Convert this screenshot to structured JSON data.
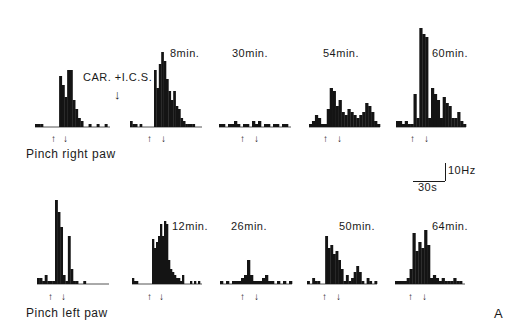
{
  "figure": {
    "panel_letter": "A",
    "treatment_label": "CAR. +I.C.S.",
    "row_labels": [
      "Pinch right paw",
      "Pinch left paw"
    ],
    "scale_bar": {
      "vertical": "10Hz",
      "horizontal": "30s"
    }
  },
  "chart_data": {
    "type": "bar",
    "title": "",
    "xlabel": "Time (bins)",
    "ylabel": "Firing rate (Hz)",
    "scale": {
      "y_bar": "10Hz",
      "x_bar": "30s"
    },
    "annotations": [
      "CAR. +I.C.S.",
      "A",
      "Pinch right paw",
      "Pinch left paw",
      "↑ pinch start",
      "↓ pinch end"
    ],
    "rows": [
      {
        "label": "Pinch right paw",
        "panels": [
          {
            "time": "control",
            "values": [
              1,
              1,
              1,
              0,
              0,
              0,
              0,
              0,
              0,
              17,
              14,
              10,
              19,
              19,
              9,
              6,
              3,
              2,
              0,
              0,
              1,
              0,
              0,
              1,
              0,
              0,
              1,
              0
            ]
          },
          {
            "time": "8min.",
            "values": [
              2,
              1,
              1,
              0,
              1,
              0,
              0,
              0,
              0,
              0,
              19,
              13,
              21,
              25,
              22,
              16,
              12,
              9,
              12,
              7,
              6,
              3,
              2,
              1,
              1,
              1,
              1,
              0,
              0,
              0
            ]
          },
          {
            "time": "30min.",
            "values": [
              1,
              1,
              0,
              1,
              1,
              2,
              1,
              0,
              1,
              1,
              0,
              2,
              1,
              2,
              0,
              1,
              1,
              0,
              1,
              1,
              0,
              1,
              1,
              0
            ]
          },
          {
            "time": "54min.",
            "values": [
              1,
              2,
              4,
              3,
              1,
              1,
              6,
              13,
              12,
              7,
              9,
              5,
              4,
              6,
              5,
              4,
              3,
              4,
              5,
              8,
              7,
              5,
              2,
              1
            ]
          },
          {
            "time": "60min.",
            "values": [
              2,
              2,
              1,
              2,
              1,
              1,
              11,
              3,
              33,
              31,
              30,
              3,
              13,
              11,
              9,
              3,
              10,
              8,
              7,
              3,
              3,
              5,
              2,
              1
            ]
          }
        ]
      },
      {
        "label": "Pinch left paw",
        "panels": [
          {
            "time": "control",
            "values": [
              2,
              2,
              1,
              3,
              1,
              1,
              1,
              28,
              24,
              19,
              3,
              1,
              16,
              5,
              1,
              1,
              0,
              0,
              1,
              0,
              0,
              0,
              0,
              0,
              0,
              0,
              0,
              0
            ]
          },
          {
            "time": "12min.",
            "values": [
              2,
              1,
              1,
              0,
              0,
              0,
              0,
              0,
              0,
              0,
              15,
              12,
              14,
              16,
              20,
              16,
              21,
              20,
              8,
              5,
              4,
              3,
              2,
              2,
              1,
              3,
              0,
              0,
              0,
              1,
              0,
              1,
              0,
              1,
              0
            ]
          },
          {
            "time": "26min.",
            "values": [
              1,
              0,
              1,
              0,
              1,
              1,
              1,
              2,
              3,
              8,
              3,
              1,
              1,
              1,
              2,
              3,
              1,
              1,
              0,
              1,
              0,
              1,
              0,
              1
            ]
          },
          {
            "time": "50min.",
            "values": [
              1,
              0,
              2,
              1,
              1,
              0,
              0,
              16,
              12,
              13,
              10,
              11,
              8,
              5,
              1,
              3,
              1,
              2,
              4,
              6,
              4,
              1,
              0,
              2,
              1,
              0,
              1
            ]
          },
          {
            "time": "64min.",
            "values": [
              1,
              1,
              1,
              1,
              2,
              5,
              17,
              11,
              14,
              12,
              18,
              13,
              2,
              3,
              2,
              1,
              2,
              1,
              1,
              1,
              2,
              1,
              1,
              0
            ]
          }
        ]
      }
    ]
  }
}
